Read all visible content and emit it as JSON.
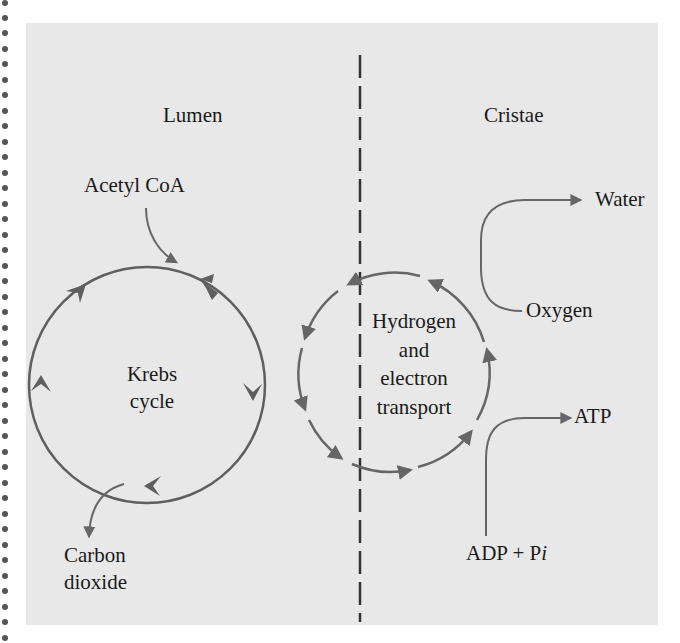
{
  "diagram": {
    "regions": {
      "left": "Lumen",
      "right": "Cristae"
    },
    "krebs": {
      "label_line1": "Krebs",
      "label_line2": "cycle",
      "input": "Acetyl CoA",
      "output_line1": "Carbon",
      "output_line2": "dioxide"
    },
    "electron_transport": {
      "line1": "Hydrogen",
      "line2": "and",
      "line3": "electron",
      "line4": "transport"
    },
    "oxygen_water": {
      "input": "Oxygen",
      "output": "Water"
    },
    "atp": {
      "input_main": "ADP + P",
      "input_italic": "i",
      "output": "ATP"
    },
    "colors": {
      "background": "#e8e8e8",
      "arrow": "#666666",
      "text": "#1a1a1a",
      "divider": "#333333"
    }
  }
}
